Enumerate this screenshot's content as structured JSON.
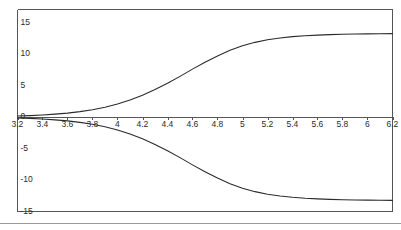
{
  "figure": {
    "frame_color": "#555555",
    "curve_color": "#2b2b2b",
    "axis_color": "#555555",
    "background": "#ffffff",
    "separator_color": "#9a9a9a"
  },
  "chart_data": {
    "type": "line",
    "title": "",
    "xlabel": "",
    "ylabel": "",
    "xlim": [
      3.2,
      6.2
    ],
    "ylim": [
      -15,
      15
    ],
    "grid": false,
    "legend": null,
    "x_ticks": [
      3.2,
      3.4,
      3.6,
      3.8,
      4,
      4.2,
      4.4,
      4.6,
      4.8,
      5,
      5.2,
      5.4,
      5.6,
      5.8,
      6,
      6.2
    ],
    "x_tick_labels": [
      "3.2",
      "3.4",
      "3.6",
      "3.8",
      "4",
      "4.2",
      "4.4",
      "4.6",
      "4.8",
      "5",
      "5.2",
      "5.4",
      "5.6",
      "5.8",
      "6",
      "6.2"
    ],
    "y_ticks": [
      15,
      10,
      5,
      0,
      -5,
      -10,
      -15
    ],
    "y_tick_labels": [
      "15",
      "10",
      "5",
      "0",
      "-5",
      "-10",
      "-15"
    ],
    "x": [
      3.2,
      3.3,
      3.4,
      3.5,
      3.6,
      3.7,
      3.8,
      3.9,
      4.0,
      4.1,
      4.2,
      4.3,
      4.4,
      4.5,
      4.6,
      4.7,
      4.8,
      4.9,
      5.0,
      5.1,
      5.2,
      5.3,
      5.4,
      5.5,
      5.6,
      5.7,
      5.8,
      5.9,
      6.0,
      6.1,
      6.2
    ],
    "series": [
      {
        "name": "upper-branch",
        "values": [
          0.15,
          0.22,
          0.32,
          0.45,
          0.62,
          0.85,
          1.15,
          1.55,
          2.05,
          2.7,
          3.45,
          4.35,
          5.35,
          6.45,
          7.6,
          8.7,
          9.7,
          10.6,
          11.3,
          11.85,
          12.25,
          12.55,
          12.75,
          12.9,
          13.0,
          13.08,
          13.13,
          13.17,
          13.2,
          13.22,
          13.24
        ]
      },
      {
        "name": "lower-branch",
        "values": [
          -0.15,
          -0.22,
          -0.32,
          -0.45,
          -0.62,
          -0.85,
          -1.15,
          -1.55,
          -2.05,
          -2.7,
          -3.45,
          -4.35,
          -5.35,
          -6.45,
          -7.6,
          -8.7,
          -9.7,
          -10.6,
          -11.3,
          -11.85,
          -12.25,
          -12.55,
          -12.75,
          -12.9,
          -13.0,
          -13.08,
          -13.13,
          -13.17,
          -13.2,
          -13.22,
          -13.24
        ]
      }
    ]
  }
}
